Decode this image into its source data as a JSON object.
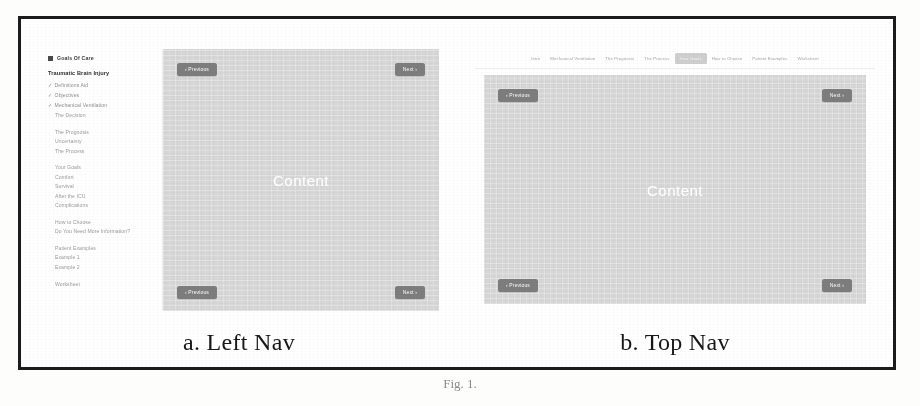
{
  "figure": {
    "caption_number": "Fig. 1.",
    "panel_a_caption": "a. Left Nav",
    "panel_b_caption": "b. Top Nav"
  },
  "left_nav_mock": {
    "brand": {
      "icon": "square-bullet-icon",
      "label": "Goals Of Care"
    },
    "heading": "Traumatic Brain Injury",
    "nav_groups": [
      {
        "items": [
          {
            "label": "Definitions Aid",
            "state": "completed",
            "check": "✓"
          },
          {
            "label": "Objectives",
            "state": "completed",
            "check": "✓"
          },
          {
            "label": "Mechanical Ventilation",
            "state": "completed",
            "check": "✓"
          },
          {
            "label": "The Decision",
            "state": "default",
            "check": ""
          }
        ]
      },
      {
        "items": [
          {
            "label": "The Prognosis",
            "state": "default",
            "check": ""
          },
          {
            "label": "Uncertainty",
            "state": "default",
            "check": ""
          },
          {
            "label": "The Process",
            "state": "default",
            "check": ""
          }
        ]
      },
      {
        "items": [
          {
            "label": "Your Goals",
            "state": "default",
            "check": ""
          },
          {
            "label": "Comfort",
            "state": "default",
            "check": ""
          },
          {
            "label": "Survival",
            "state": "default",
            "check": ""
          },
          {
            "label": "After the ICU",
            "state": "default",
            "check": ""
          },
          {
            "label": "Complications",
            "state": "default",
            "check": ""
          }
        ]
      },
      {
        "items": [
          {
            "label": "How to Choose",
            "state": "default",
            "check": ""
          },
          {
            "label": "Do You Need More Information?",
            "state": "default",
            "check": ""
          }
        ]
      },
      {
        "items": [
          {
            "label": "Patient Examples",
            "state": "default",
            "check": ""
          },
          {
            "label": "Example 1",
            "state": "default",
            "check": ""
          },
          {
            "label": "Example 2",
            "state": "default",
            "check": ""
          }
        ]
      },
      {
        "items": [
          {
            "label": "Worksheet",
            "state": "default",
            "check": ""
          }
        ]
      }
    ],
    "content_label": "Content",
    "buttons": {
      "previous_top": "‹ Previous",
      "next_top": "Next ›",
      "previous_bottom": "‹ Previous",
      "next_bottom": "Next ›"
    }
  },
  "top_nav_mock": {
    "tabs": [
      {
        "label": "Intro",
        "active": false
      },
      {
        "label": "Mechanical Ventilation",
        "active": false
      },
      {
        "label": "The Prognosis",
        "active": false
      },
      {
        "label": "The Process",
        "active": false
      },
      {
        "label": "Your Goals",
        "active": true
      },
      {
        "label": "How to Choose",
        "active": false
      },
      {
        "label": "Patient Examples",
        "active": false
      },
      {
        "label": "Worksheet",
        "active": false
      }
    ],
    "content_label": "Content",
    "buttons": {
      "previous_top": "‹ Previous",
      "next_top": "Next ›",
      "previous_bottom": "‹ Previous",
      "next_bottom": "Next ›"
    }
  },
  "colors": {
    "frame_border": "#1c1c1c",
    "content_stage": "#d6d6d6",
    "nav_button": "#7d7d7d",
    "active_tab": "#cfcfcf",
    "nav_item_text": "#9a9a9a"
  }
}
